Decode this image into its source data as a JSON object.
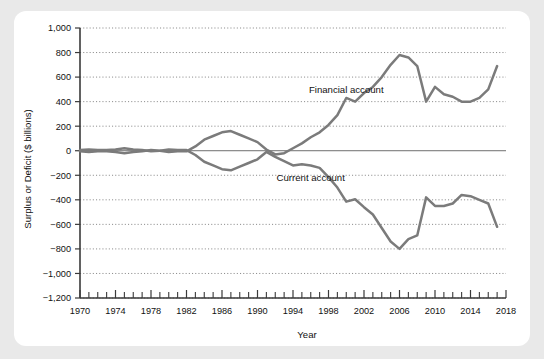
{
  "chart_data": {
    "type": "line",
    "title": "",
    "xlabel": "Year",
    "ylabel": "Surplus or Deficit ($ billions)",
    "xlim": [
      1970,
      2018
    ],
    "ylim": [
      -1200,
      1000
    ],
    "y_ticks": [
      "1,000",
      "800",
      "600",
      "400",
      "200",
      "0",
      "−200",
      "−400",
      "−600",
      "−800",
      "−1,000",
      "−1,200"
    ],
    "y_tick_values": [
      1000,
      800,
      600,
      400,
      200,
      0,
      -200,
      -400,
      -600,
      -800,
      -1000,
      -1200
    ],
    "x_ticks": [
      "1970",
      "1974",
      "1978",
      "1982",
      "1986",
      "1990",
      "1994",
      "1998",
      "2002",
      "2006",
      "2010",
      "2014",
      "2018"
    ],
    "x_tick_values": [
      1970,
      1974,
      1978,
      1982,
      1986,
      1990,
      1994,
      1998,
      2002,
      2006,
      2010,
      2014,
      2018
    ],
    "x_minor_step": 1,
    "grid": "horizontal-dotted",
    "legend": "inline-annotations",
    "annotations": [
      {
        "text": "Financial account",
        "x": 2000,
        "y": 470
      },
      {
        "text": "Current account",
        "x": 1996,
        "y": -250
      }
    ],
    "x": [
      1970,
      1971,
      1972,
      1973,
      1974,
      1975,
      1976,
      1977,
      1978,
      1979,
      1980,
      1981,
      1982,
      1983,
      1984,
      1985,
      1986,
      1987,
      1988,
      1989,
      1990,
      1991,
      1992,
      1993,
      1994,
      1995,
      1996,
      1997,
      1998,
      1999,
      2000,
      2001,
      2002,
      2003,
      2004,
      2005,
      2006,
      2007,
      2008,
      2009,
      2010,
      2011,
      2012,
      2013,
      2014,
      2015,
      2016,
      2017
    ],
    "series": [
      {
        "name": "Financial account",
        "values": [
          -5,
          -10,
          -5,
          -5,
          -10,
          -20,
          -10,
          -5,
          5,
          0,
          -10,
          -5,
          -5,
          35,
          90,
          120,
          150,
          160,
          130,
          100,
          70,
          10,
          -30,
          -20,
          20,
          60,
          110,
          150,
          210,
          290,
          430,
          400,
          470,
          520,
          600,
          700,
          780,
          760,
          690,
          400,
          520,
          460,
          440,
          400,
          400,
          430,
          500,
          690
        ]
      },
      {
        "name": "Current account",
        "values": [
          5,
          10,
          5,
          5,
          10,
          20,
          10,
          5,
          -5,
          0,
          10,
          5,
          5,
          -35,
          -90,
          -120,
          -150,
          -160,
          -130,
          -100,
          -70,
          -10,
          -50,
          -85,
          -120,
          -110,
          -120,
          -140,
          -215,
          -300,
          -415,
          -395,
          -460,
          -520,
          -630,
          -740,
          -800,
          -720,
          -690,
          -380,
          -450,
          -450,
          -430,
          -360,
          -370,
          -400,
          -430,
          -620
        ]
      }
    ]
  },
  "axis_titles": {
    "x": "Year",
    "y": "Surplus or Deficit ($ billions)"
  }
}
